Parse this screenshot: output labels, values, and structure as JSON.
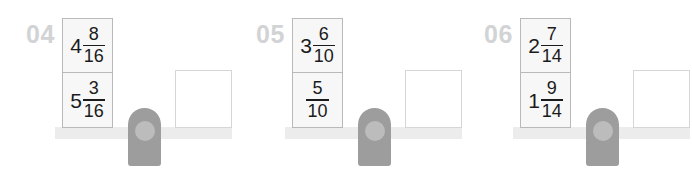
{
  "worksheet": {
    "background_color": "#ffffff",
    "card_fill_color": "#f7f7f7",
    "card_border_color": "#b9b9b9",
    "beam_color": "#ececec",
    "fulcrum_color": "#9d9d9d",
    "fulcrum_inner_color": "#bcbcbc",
    "number_label_color": "#d2d3d5",
    "answer_box_border_color": "#d6d6d6"
  },
  "problems": [
    {
      "number": "04",
      "cards": [
        {
          "whole": "4",
          "numerator": "8",
          "denominator": "16"
        },
        {
          "whole": "5",
          "numerator": "3",
          "denominator": "16"
        }
      ],
      "answer": ""
    },
    {
      "number": "05",
      "cards": [
        {
          "whole": "3",
          "numerator": "6",
          "denominator": "10"
        },
        {
          "whole": "",
          "numerator": "5",
          "denominator": "10"
        }
      ],
      "answer": ""
    },
    {
      "number": "06",
      "cards": [
        {
          "whole": "2",
          "numerator": "7",
          "denominator": "14"
        },
        {
          "whole": "1",
          "numerator": "9",
          "denominator": "14"
        }
      ],
      "answer": ""
    }
  ]
}
